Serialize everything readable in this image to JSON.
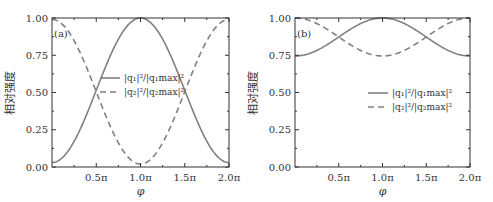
{
  "figure": {
    "panels": [
      {
        "tag": "(a)",
        "ylabel": "相对强度",
        "xlabel": "φ",
        "yticks": [
          "0.00",
          "0.25",
          "0.50",
          "0.75",
          "1.00"
        ],
        "xticks": [
          "0.5π",
          "1.0π",
          "1.5π",
          "2.0π"
        ],
        "legend": [
          "|q₁|²/|q₁max|²",
          "|q₂|²/|q₂max|²"
        ]
      },
      {
        "tag": "(b)",
        "ylabel": "相对强度",
        "xlabel": "φ",
        "yticks": [
          "0.00",
          "0.25",
          "0.50",
          "0.75",
          "1.00"
        ],
        "xticks": [
          "0.5π",
          "1.0π",
          "1.5π",
          "2.0π"
        ],
        "legend": [
          "|q₁|²/|q₁max|²",
          "|q₂|²/|q₂max|²"
        ]
      }
    ],
    "colors": {
      "curve": "#808080",
      "axis": "#333333"
    }
  },
  "chart_data": [
    {
      "type": "line",
      "title": "(a)",
      "xlabel": "φ",
      "ylabel": "相对强度",
      "xlim": [
        0,
        6.2832
      ],
      "ylim": [
        0,
        1.0
      ],
      "x_tick_labels": [
        "0.5π",
        "1.0π",
        "1.5π",
        "2.0π"
      ],
      "y_tick_labels": [
        "0.00",
        "0.25",
        "0.50",
        "0.75",
        "1.00"
      ],
      "grid": false,
      "legend_position": "center",
      "x": [
        0,
        0.25,
        0.5,
        0.75,
        1.0,
        1.25,
        1.5,
        1.75,
        2.0
      ],
      "x_units": "π",
      "series": [
        {
          "name": "|q₁|²/|q₁max|²",
          "style": "solid",
          "values": [
            0.03,
            0.17,
            0.5,
            0.85,
            1.0,
            0.85,
            0.5,
            0.17,
            0.03
          ]
        },
        {
          "name": "|q₂|²/|q₂max|²",
          "style": "dashed",
          "values": [
            0.99,
            0.85,
            0.5,
            0.17,
            0.02,
            0.17,
            0.5,
            0.85,
            0.99
          ]
        }
      ]
    },
    {
      "type": "line",
      "title": "(b)",
      "xlabel": "φ",
      "ylabel": "相对强度",
      "xlim": [
        0,
        6.2832
      ],
      "ylim": [
        0,
        1.0
      ],
      "x_tick_labels": [
        "0.5π",
        "1.0π",
        "1.5π",
        "2.0π"
      ],
      "y_tick_labels": [
        "0.00",
        "0.25",
        "0.50",
        "0.75",
        "1.00"
      ],
      "grid": false,
      "legend_position": "center-right",
      "x": [
        0,
        0.25,
        0.5,
        0.75,
        1.0,
        1.25,
        1.5,
        1.75,
        2.0
      ],
      "x_units": "π",
      "series": [
        {
          "name": "|q₁|²/|q₁max|²",
          "style": "solid",
          "values": [
            0.745,
            0.78,
            0.87,
            0.96,
            1.0,
            0.96,
            0.87,
            0.78,
            0.745
          ]
        },
        {
          "name": "|q₂|²/|q₂max|²",
          "style": "dashed",
          "values": [
            1.0,
            0.96,
            0.87,
            0.78,
            0.745,
            0.78,
            0.87,
            0.96,
            1.0
          ]
        }
      ]
    }
  ]
}
